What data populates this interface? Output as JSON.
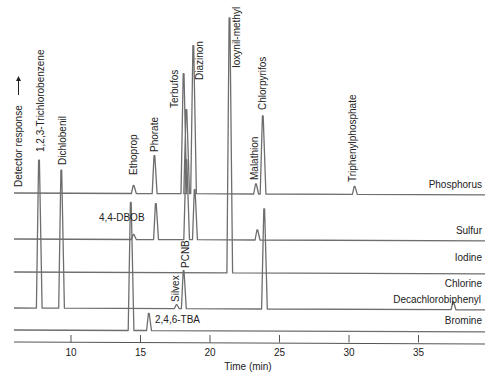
{
  "chart_data": {
    "type": "line",
    "title": "",
    "xlabel": "Time (min)",
    "ylabel": "Detector response →",
    "xlim": [
      6,
      40
    ],
    "x_ticks": [
      10,
      15,
      20,
      25,
      30,
      35
    ],
    "grid": false,
    "legend_position": "inline-right",
    "series": [
      {
        "name": "Phosphorus",
        "baseline_y": 193,
        "peaks": [
          {
            "label": "Ethoprop",
            "t": 14.5,
            "height": 8
          },
          {
            "label": "Phorate",
            "t": 16.0,
            "height": 38
          },
          {
            "label": "Terbufos",
            "t": 18.1,
            "height": 120
          },
          {
            "label": "",
            "t": 18.3,
            "height": 84
          },
          {
            "label": "Diazinon",
            "t": 18.8,
            "height": 148
          },
          {
            "label": "Malathion",
            "t": 23.3,
            "height": 10
          },
          {
            "label": "Chlorpyrifos",
            "t": 23.8,
            "height": 78
          },
          {
            "label": "Triphenylphosphate",
            "t": 30.4,
            "height": 8
          }
        ]
      },
      {
        "name": "Sulfur",
        "baseline_y": 239,
        "peaks": [
          {
            "label": "",
            "t": 14.5,
            "height": 5
          },
          {
            "label": "",
            "t": 16.1,
            "height": 36
          },
          {
            "label": "",
            "t": 18.3,
            "height": 80
          },
          {
            "label": "",
            "t": 18.9,
            "height": 50
          },
          {
            "label": "",
            "t": 23.4,
            "height": 10
          }
        ]
      },
      {
        "name": "Iodine",
        "baseline_y": 272,
        "peaks": [
          {
            "label": "Ioxynil-methyl",
            "t": 21.4,
            "height": 255
          }
        ]
      },
      {
        "name": "Chlorine",
        "baseline_y": 308,
        "peaks": [
          {
            "label": "1,2,3-Trichlorobenzene",
            "t": 7.7,
            "height": 148
          },
          {
            "label": "Dichlobenil",
            "t": 9.3,
            "height": 138
          },
          {
            "label": "Silvex",
            "t": 17.6,
            "height": 4
          },
          {
            "label": "PCNB",
            "t": 18.1,
            "height": 38
          },
          {
            "label": "",
            "t": 23.9,
            "height": 100
          },
          {
            "label": "Decachlorobiphenyl",
            "t": 37.5,
            "height": 8
          }
        ]
      },
      {
        "name": "Bromine",
        "baseline_y": 330,
        "peaks": [
          {
            "label": "4,4-DBOB",
            "t": 14.3,
            "height": 128
          },
          {
            "label": "2,4,6-TBA",
            "t": 15.6,
            "height": 17
          }
        ]
      }
    ]
  },
  "axis": {
    "label": "Time (min)",
    "ticks": [
      "10",
      "15",
      "20",
      "25",
      "30",
      "35"
    ]
  },
  "y_axis_label": "Detector response",
  "channels": [
    "Phosphorus",
    "Sulfur",
    "Iodine",
    "Chlorine",
    "Bromine"
  ],
  "peak_labels": {
    "trichlorobenzene": "1,2,3-Trichlorobenzene",
    "dichlobenil": "Dichlobenil",
    "ethoprop": "Ethoprop",
    "phorate": "Phorate",
    "terbufos": "Terbufos",
    "diazinon": "Diazinon",
    "ioxynil": "Ioxynil-methyl",
    "malathion": "Malathion",
    "chlorpyrifos": "Chlorpyrifos",
    "triphenylphosphate": "Triphenylphosphate",
    "dbob": "4,4-DBOB",
    "pcnb": "PCNB",
    "silvex": "Silvex",
    "decachlorobiphenyl": "Decachlorobiphenyl",
    "tba": "2,4,6-TBA"
  },
  "colors": {
    "trace": "#6e6e6e",
    "text": "#222222",
    "axis": "#555555"
  }
}
